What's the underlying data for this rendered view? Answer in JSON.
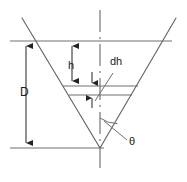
{
  "figure": {
    "type": "engineering-cross-section-diagram",
    "stroke_color": "#555555",
    "label_color": "#1a1a1a",
    "background_color": "#ffffff"
  },
  "labels": {
    "depth": "D",
    "head": "h",
    "differential_head": "dh",
    "notch_angle": "θ"
  },
  "annotations": {
    "depth_description": "Total notch depth dimension, measured from the crest line to the apex",
    "head_description": "Head above the elemental strip",
    "differential_head_description": "Elemental strip thickness",
    "notch_angle_description": "Half-angle of the V-notch measured from the vertical centerline"
  },
  "geometry": {
    "apex": {
      "x": 100,
      "y": 148
    },
    "left_side_top": {
      "x": 22,
      "y": 18
    },
    "right_side_top": {
      "x": 176,
      "y": 18
    },
    "centerline_top": {
      "x": 100,
      "y": 10
    },
    "centerline_bottom": {
      "x": 100,
      "y": 172
    },
    "horizontal_lines": [
      {
        "name": "crest-line",
        "y": 41,
        "x1": 10,
        "x2": 172
      },
      {
        "name": "strip-top-line",
        "y": 86,
        "x1": 63,
        "x2": 138
      },
      {
        "name": "strip-bottom-line",
        "y": 95,
        "x1": 69,
        "x2": 132
      },
      {
        "name": "apex-base-line",
        "y": 148,
        "x1": 10,
        "x2": 104
      }
    ],
    "dimension_lines": [
      {
        "name": "D-dimension",
        "x": 26,
        "y1": 41,
        "y2": 148,
        "arrows": "both"
      },
      {
        "name": "h-dimension",
        "x": 72,
        "y1": 41,
        "y2": 86,
        "arrows": "both"
      },
      {
        "name": "dh-dimension",
        "x": 92,
        "y1": 86,
        "y2": 95,
        "arrows": "both"
      }
    ],
    "leader_line": {
      "name": "dh-leader",
      "x1": 112,
      "y1": 74,
      "x2": 94,
      "y2": 100
    },
    "angle_arc": {
      "name": "theta-arc",
      "cx": 100,
      "cy": 148,
      "radius": 30
    }
  }
}
